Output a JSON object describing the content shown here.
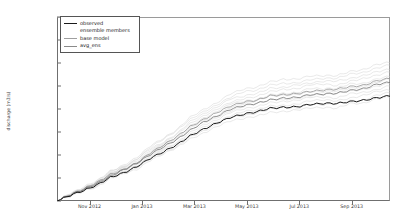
{
  "chart_data": {
    "type": "line",
    "title": "",
    "xlabel": "",
    "ylabel": "discharge (m3/s)",
    "ylim": [
      0,
      800000000
    ],
    "yticks": [
      0,
      100000000,
      200000000,
      300000000,
      400000000,
      500000000,
      600000000,
      700000000,
      800000000
    ],
    "ytick_labels": [
      "0",
      "100,000,000",
      "200,000,000",
      "300,000,000",
      "400,000,000",
      "500,000,000",
      "600,000,000",
      "700,000,000",
      "800,000,000"
    ],
    "xtick_labels": [
      "Nov 2012",
      "Jan 2013",
      "Mar 2013",
      "May 2013",
      "Jul 2013",
      "Sep 2013"
    ],
    "x": [
      0,
      0.5,
      1,
      1.5,
      2,
      2.5,
      3,
      3.5,
      4,
      4.5,
      5,
      5.5,
      6,
      6.5,
      7,
      7.5,
      8,
      8.5,
      9,
      9.5,
      10,
      10.5,
      11,
      11.5,
      12,
      12.5
    ],
    "grid": false,
    "legend_position": "upper left",
    "series": [
      {
        "name": "observed",
        "color": "#1a1a1a",
        "style": "solid",
        "values": [
          0,
          22000000,
          45000000,
          72000000,
          98000000,
          122000000,
          150000000,
          182000000,
          215000000,
          250000000,
          282000000,
          312000000,
          340000000,
          362000000,
          378000000,
          392000000,
          400000000,
          408000000,
          414000000,
          418000000,
          422000000,
          426000000,
          430000000,
          438000000,
          452000000,
          455000000
        ]
      },
      {
        "name": "ensemble members",
        "color": "#c9c9c9",
        "style": "solid-thin-band",
        "values": [
          0,
          26000000,
          54000000,
          86000000,
          118000000,
          146000000,
          180000000,
          218000000,
          256000000,
          296000000,
          336000000,
          372000000,
          406000000,
          432000000,
          452000000,
          468000000,
          480000000,
          490000000,
          498000000,
          504000000,
          510000000,
          516000000,
          522000000,
          534000000,
          558000000,
          562000000
        ]
      },
      {
        "name": "base model",
        "color": "#8c8c8c",
        "style": "solid",
        "values": [
          0,
          25000000,
          52000000,
          82000000,
          112000000,
          139000000,
          171000000,
          207000000,
          243000000,
          281000000,
          319000000,
          353000000,
          385000000,
          410000000,
          428000000,
          443000000,
          454000000,
          463000000,
          470000000,
          476000000,
          481000000,
          487000000,
          493000000,
          504000000,
          527000000,
          531000000
        ]
      },
      {
        "name": "avg_ens",
        "color": "#6e6e6e",
        "style": "solid",
        "values": [
          0,
          24000000,
          50000000,
          79000000,
          108000000,
          134000000,
          165000000,
          200000000,
          235000000,
          272000000,
          308000000,
          341000000,
          372000000,
          396000000,
          414000000,
          428000000,
          439000000,
          448000000,
          455000000,
          460000000,
          465000000,
          471000000,
          477000000,
          488000000,
          510000000,
          514000000
        ]
      }
    ]
  },
  "legend": {
    "items": [
      {
        "label": "observed",
        "color": "#1a1a1a",
        "show_swatch": true
      },
      {
        "label": "ensemble members",
        "color": "#d8d8d8",
        "show_swatch": false
      },
      {
        "label": "base model",
        "color": "#9f9f9f",
        "show_swatch": true
      },
      {
        "label": "avg_ens",
        "color": "#8a8a8a",
        "show_swatch": true
      }
    ]
  }
}
